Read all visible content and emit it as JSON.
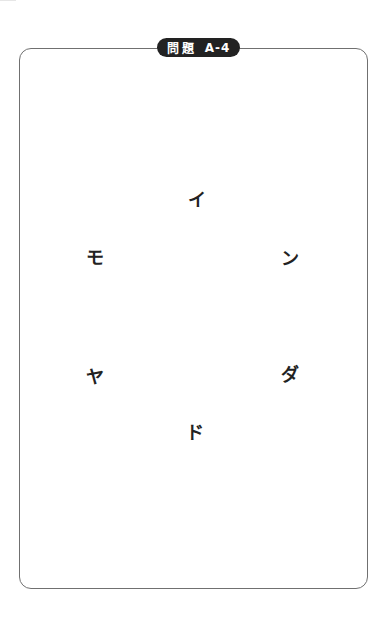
{
  "badge": {
    "kanji": "問題",
    "code": "A-4"
  },
  "colors": {
    "frame_border": "#707070",
    "badge_bg": "#222222",
    "badge_text": "#ffffff",
    "kana_text": "#222222"
  },
  "puzzle": {
    "characters": [
      {
        "char": "イ",
        "x": 197,
        "y": 198
      },
      {
        "char": "モ",
        "x": 95,
        "y": 256
      },
      {
        "char": "ン",
        "x": 290,
        "y": 257
      },
      {
        "char": "ヤ",
        "x": 95,
        "y": 375
      },
      {
        "char": "ダ",
        "x": 290,
        "y": 373
      },
      {
        "char": "ド",
        "x": 195,
        "y": 431
      }
    ]
  }
}
